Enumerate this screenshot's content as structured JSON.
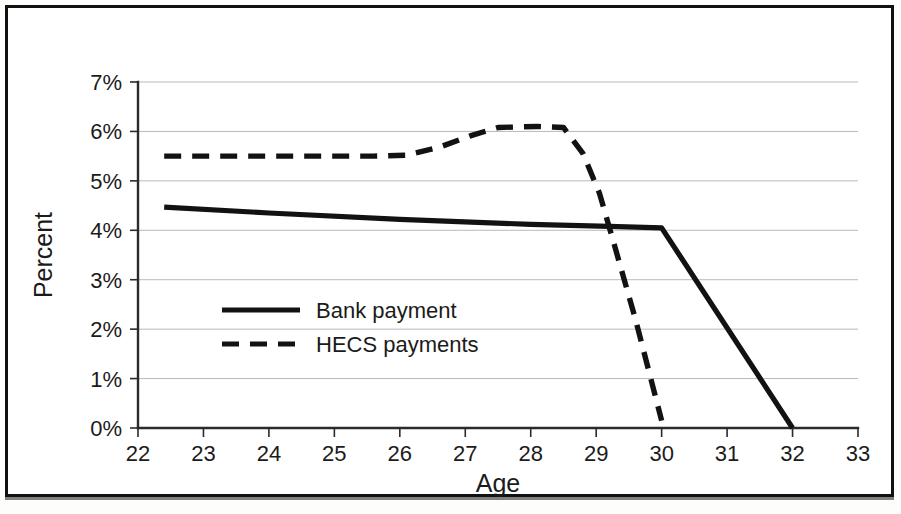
{
  "figure": {
    "background_color": "#ffffff",
    "frame_color": "#111111",
    "axis_color": "#2b2b2b",
    "grid_color": "#b9b9b9",
    "series_color": "#121212"
  },
  "axes": {
    "x_title": "Age",
    "y_title": "Percent",
    "x_tick_labels": [
      "22",
      "23",
      "24",
      "25",
      "26",
      "27",
      "28",
      "29",
      "30",
      "31",
      "32",
      "33"
    ],
    "y_tick_labels": [
      "0%",
      "1%",
      "2%",
      "3%",
      "4%",
      "5%",
      "6%",
      "7%"
    ]
  },
  "legend": {
    "items": [
      {
        "label": "Bank payment",
        "style": "solid"
      },
      {
        "label": "HECS payments",
        "style": "dashed"
      }
    ]
  },
  "chart_data": {
    "type": "line",
    "title": "",
    "subtitle": "",
    "xlabel": "Age",
    "ylabel": "Percent",
    "xlim": [
      22,
      33
    ],
    "ylim": [
      0,
      7
    ],
    "x_ticks": [
      22,
      23,
      24,
      25,
      26,
      27,
      28,
      29,
      30,
      31,
      32,
      33
    ],
    "y_ticks": [
      0,
      1,
      2,
      3,
      4,
      5,
      6,
      7
    ],
    "y_tick_format": "percent",
    "grid": "horizontal",
    "legend_position": "inside-lower-left",
    "series": [
      {
        "name": "Bank payment",
        "style": "solid",
        "color": "#121212",
        "points": [
          {
            "x": 22.4,
            "y": 4.47
          },
          {
            "x": 24.0,
            "y": 4.35
          },
          {
            "x": 26.0,
            "y": 4.22
          },
          {
            "x": 28.0,
            "y": 4.12
          },
          {
            "x": 29.2,
            "y": 4.08
          },
          {
            "x": 30.0,
            "y": 4.05
          },
          {
            "x": 32.0,
            "y": 0.0
          }
        ]
      },
      {
        "name": "HECS payments",
        "style": "dashed",
        "color": "#121212",
        "points": [
          {
            "x": 22.4,
            "y": 5.5
          },
          {
            "x": 24.0,
            "y": 5.5
          },
          {
            "x": 25.6,
            "y": 5.5
          },
          {
            "x": 26.1,
            "y": 5.52
          },
          {
            "x": 26.6,
            "y": 5.68
          },
          {
            "x": 27.1,
            "y": 5.92
          },
          {
            "x": 27.5,
            "y": 6.08
          },
          {
            "x": 28.1,
            "y": 6.1
          },
          {
            "x": 28.5,
            "y": 6.08
          },
          {
            "x": 28.8,
            "y": 5.55
          },
          {
            "x": 29.05,
            "y": 4.75
          },
          {
            "x": 29.3,
            "y": 3.6
          },
          {
            "x": 29.6,
            "y": 2.2
          },
          {
            "x": 30.0,
            "y": 0.15
          }
        ]
      }
    ]
  }
}
